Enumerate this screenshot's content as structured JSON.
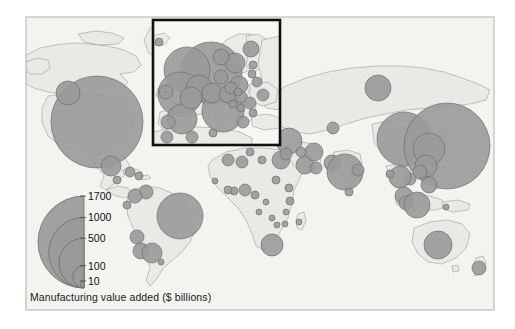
{
  "figure": {
    "type": "proportional-symbol-map",
    "caption": "Manufacturing value added ($ billions)",
    "frame": {
      "x": 26,
      "y": 17,
      "width": 468,
      "height": 293
    },
    "colors": {
      "background": "#f2f2ef",
      "land": "#e8e8e4",
      "ocean": "#f6f6f4",
      "border": "#8b8b86",
      "circle_fill": "#9a9a9a",
      "circle_stroke": "#6f6f6f",
      "frame_stroke": "#b4b4b0",
      "inset_stroke": "#111111",
      "text": "#111111"
    }
  },
  "inset": {
    "name": "europe-inset",
    "label": "",
    "x": 153,
    "y": 20,
    "width": 127,
    "height": 125
  },
  "legend": {
    "title": "Manufacturing value added ($ billions)",
    "unit": "$ billions",
    "anchor_x": 84,
    "baseline_y": 288,
    "max_value": 1700,
    "max_radius": 46,
    "breaks": [
      {
        "label": "1700",
        "value": 1700
      },
      {
        "label": "1000",
        "value": 1000
      },
      {
        "label": "500",
        "value": 500
      },
      {
        "label": "100",
        "value": 100
      },
      {
        "label": "10",
        "value": 10
      }
    ]
  },
  "chart_data": {
    "type": "scatter",
    "title": "Manufacturing value added ($ billions)",
    "xlabel": "",
    "ylabel": "",
    "encoding": "circle area proportional to value",
    "legend_values": [
      1700,
      1000,
      500,
      100,
      10
    ],
    "points": [
      {
        "name": "United States",
        "value": 1700,
        "cx": 97,
        "cy": 122,
        "r": 46
      },
      {
        "name": "Canada",
        "value": 100,
        "cx": 68,
        "cy": 93,
        "r": 12
      },
      {
        "name": "Mexico",
        "value": 90,
        "cx": 111,
        "cy": 166,
        "r": 10
      },
      {
        "name": "Guatemala",
        "value": 10,
        "cx": 117,
        "cy": 180,
        "r": 4
      },
      {
        "name": "Cuba",
        "value": 12,
        "cx": 130,
        "cy": 172,
        "r": 5
      },
      {
        "name": "Dominican Republic",
        "value": 8,
        "cx": 139,
        "cy": 176,
        "r": 4
      },
      {
        "name": "Venezuela",
        "value": 30,
        "cx": 146,
        "cy": 192,
        "r": 7
      },
      {
        "name": "Colombia",
        "value": 28,
        "cx": 135,
        "cy": 196,
        "r": 7
      },
      {
        "name": "Ecuador",
        "value": 9,
        "cx": 127,
        "cy": 205,
        "r": 4
      },
      {
        "name": "Brazil",
        "value": 400,
        "cx": 180,
        "cy": 216,
        "r": 23
      },
      {
        "name": "Peru",
        "value": 22,
        "cx": 137,
        "cy": 237,
        "r": 7
      },
      {
        "name": "Chile",
        "value": 25,
        "cx": 141,
        "cy": 251,
        "r": 8
      },
      {
        "name": "Argentina",
        "value": 60,
        "cx": 152,
        "cy": 253,
        "r": 10
      },
      {
        "name": "Uruguay",
        "value": 6,
        "cx": 161,
        "cy": 262,
        "r": 3
      },
      {
        "name": "Morocco",
        "value": 14,
        "cx": 228,
        "cy": 160,
        "r": 6
      },
      {
        "name": "Algeria",
        "value": 16,
        "cx": 242,
        "cy": 162,
        "r": 6
      },
      {
        "name": "Tunisia",
        "value": 9,
        "cx": 250,
        "cy": 152,
        "r": 4
      },
      {
        "name": "Libya",
        "value": 8,
        "cx": 262,
        "cy": 160,
        "r": 4
      },
      {
        "name": "Egypt",
        "value": 40,
        "cx": 281,
        "cy": 160,
        "r": 9
      },
      {
        "name": "Nigeria",
        "value": 20,
        "cx": 245,
        "cy": 190,
        "r": 6
      },
      {
        "name": "Ghana",
        "value": 8,
        "cx": 234,
        "cy": 191,
        "r": 4
      },
      {
        "name": "Ivory Coast",
        "value": 7,
        "cx": 228,
        "cy": 190,
        "r": 4
      },
      {
        "name": "Senegal",
        "value": 5,
        "cx": 215,
        "cy": 181,
        "r": 3
      },
      {
        "name": "Cameroon",
        "value": 7,
        "cx": 255,
        "cy": 195,
        "r": 4
      },
      {
        "name": "Sudan",
        "value": 9,
        "cx": 276,
        "cy": 180,
        "r": 4
      },
      {
        "name": "Ethiopia",
        "value": 7,
        "cx": 289,
        "cy": 188,
        "r": 4
      },
      {
        "name": "Kenya",
        "value": 8,
        "cx": 290,
        "cy": 201,
        "r": 4
      },
      {
        "name": "Tanzania",
        "value": 6,
        "cx": 286,
        "cy": 212,
        "r": 3
      },
      {
        "name": "Angola",
        "value": 6,
        "cx": 259,
        "cy": 212,
        "r": 3
      },
      {
        "name": "DR Congo",
        "value": 5,
        "cx": 266,
        "cy": 202,
        "r": 3
      },
      {
        "name": "Zambia",
        "value": 5,
        "cx": 272,
        "cy": 218,
        "r": 3
      },
      {
        "name": "Zimbabwe",
        "value": 6,
        "cx": 277,
        "cy": 225,
        "r": 3
      },
      {
        "name": "Mozambique",
        "value": 5,
        "cx": 285,
        "cy": 224,
        "r": 3
      },
      {
        "name": "Madagascar",
        "value": 4,
        "cx": 299,
        "cy": 222,
        "r": 3
      },
      {
        "name": "South Africa",
        "value": 80,
        "cx": 272,
        "cy": 245,
        "r": 11
      },
      {
        "name": "Turkey",
        "value": 110,
        "cx": 289,
        "cy": 141,
        "r": 13
      },
      {
        "name": "Israel",
        "value": 30,
        "cx": 286,
        "cy": 154,
        "r": 6
      },
      {
        "name": "Saudi Arabia",
        "value": 45,
        "cx": 305,
        "cy": 165,
        "r": 9
      },
      {
        "name": "Iran",
        "value": 55,
        "cx": 314,
        "cy": 152,
        "r": 9
      },
      {
        "name": "Iraq",
        "value": 14,
        "cx": 301,
        "cy": 152,
        "r": 5
      },
      {
        "name": "UAE",
        "value": 20,
        "cx": 316,
        "cy": 168,
        "r": 6
      },
      {
        "name": "Kazakhstan",
        "value": 22,
        "cx": 333,
        "cy": 128,
        "r": 6
      },
      {
        "name": "Russia",
        "value": 200,
        "cx": 378,
        "cy": 88,
        "r": 13
      },
      {
        "name": "Pakistan",
        "value": 35,
        "cx": 332,
        "cy": 163,
        "r": 8
      },
      {
        "name": "India",
        "value": 260,
        "cx": 345,
        "cy": 172,
        "r": 18
      },
      {
        "name": "Bangladesh",
        "value": 30,
        "cx": 358,
        "cy": 170,
        "r": 6
      },
      {
        "name": "Sri Lanka",
        "value": 8,
        "cx": 349,
        "cy": 192,
        "r": 4
      },
      {
        "name": "China",
        "value": 1300,
        "cx": 404,
        "cy": 139,
        "r": 27
      },
      {
        "name": "Japan",
        "value": 1700,
        "cx": 447,
        "cy": 146,
        "r": 43
      },
      {
        "name": "South Korea",
        "value": 300,
        "cx": 429,
        "cy": 149,
        "r": 16
      },
      {
        "name": "Taiwan",
        "value": 120,
        "cx": 426,
        "cy": 166,
        "r": 11
      },
      {
        "name": "Hong Kong",
        "value": 40,
        "cx": 420,
        "cy": 172,
        "r": 7
      },
      {
        "name": "Vietnam",
        "value": 25,
        "cx": 410,
        "cy": 179,
        "r": 6
      },
      {
        "name": "Thailand",
        "value": 90,
        "cx": 400,
        "cy": 177,
        "r": 11
      },
      {
        "name": "Myanmar",
        "value": 9,
        "cx": 390,
        "cy": 174,
        "r": 4
      },
      {
        "name": "Philippines",
        "value": 40,
        "cx": 429,
        "cy": 185,
        "r": 8
      },
      {
        "name": "Malaysia",
        "value": 55,
        "cx": 404,
        "cy": 196,
        "r": 9
      },
      {
        "name": "Singapore",
        "value": 40,
        "cx": 406,
        "cy": 203,
        "r": 7
      },
      {
        "name": "Indonesia",
        "value": 110,
        "cx": 417,
        "cy": 205,
        "r": 13
      },
      {
        "name": "Papua New Guinea",
        "value": 6,
        "cx": 446,
        "cy": 207,
        "r": 3
      },
      {
        "name": "Australia",
        "value": 130,
        "cx": 438,
        "cy": 245,
        "r": 14
      },
      {
        "name": "New Zealand",
        "value": 25,
        "cx": 479,
        "cy": 268,
        "r": 7
      }
    ],
    "inset_points": [
      {
        "name": "Germany",
        "value": 900,
        "cx": 211,
        "cy": 73,
        "r": 31
      },
      {
        "name": "France",
        "value": 450,
        "cx": 187,
        "cy": 70,
        "r": 23
      },
      {
        "name": "United Kingdom",
        "value": 420,
        "cx": 180,
        "cy": 94,
        "r": 22
      },
      {
        "name": "Italy",
        "value": 380,
        "cx": 223,
        "cy": 111,
        "r": 21
      },
      {
        "name": "Spain",
        "value": 220,
        "cx": 182,
        "cy": 119,
        "r": 15
      },
      {
        "name": "Netherlands",
        "value": 180,
        "cx": 199,
        "cy": 88,
        "r": 13
      },
      {
        "name": "Belgium",
        "value": 120,
        "cx": 191,
        "cy": 98,
        "r": 11
      },
      {
        "name": "Switzerland",
        "value": 110,
        "cx": 212,
        "cy": 93,
        "r": 10
      },
      {
        "name": "Austria",
        "value": 90,
        "cx": 228,
        "cy": 94,
        "r": 9
      },
      {
        "name": "Sweden",
        "value": 95,
        "cx": 235,
        "cy": 63,
        "r": 10
      },
      {
        "name": "Poland",
        "value": 85,
        "cx": 239,
        "cy": 85,
        "r": 9
      },
      {
        "name": "Norway",
        "value": 50,
        "cx": 221,
        "cy": 57,
        "r": 8
      },
      {
        "name": "Finland",
        "value": 45,
        "cx": 251,
        "cy": 49,
        "r": 8
      },
      {
        "name": "Denmark",
        "value": 50,
        "cx": 221,
        "cy": 77,
        "r": 7
      },
      {
        "name": "Ireland",
        "value": 45,
        "cx": 166,
        "cy": 92,
        "r": 7
      },
      {
        "name": "Portugal",
        "value": 40,
        "cx": 168,
        "cy": 122,
        "r": 7
      },
      {
        "name": "Czechia",
        "value": 40,
        "cx": 231,
        "cy": 88,
        "r": 6
      },
      {
        "name": "Hungary",
        "value": 35,
        "cx": 241,
        "cy": 97,
        "r": 6
      },
      {
        "name": "Greece",
        "value": 30,
        "cx": 243,
        "cy": 122,
        "r": 6
      },
      {
        "name": "Romania",
        "value": 28,
        "cx": 250,
        "cy": 103,
        "r": 6
      },
      {
        "name": "Belarus",
        "value": 22,
        "cx": 257,
        "cy": 82,
        "r": 5
      },
      {
        "name": "Ukraine",
        "value": 30,
        "cx": 263,
        "cy": 95,
        "r": 6
      },
      {
        "name": "Slovakia",
        "value": 18,
        "cx": 238,
        "cy": 92,
        "r": 4
      },
      {
        "name": "Bulgaria",
        "value": 15,
        "cx": 253,
        "cy": 113,
        "r": 4
      },
      {
        "name": "Serbia",
        "value": 12,
        "cx": 241,
        "cy": 108,
        "r": 4
      },
      {
        "name": "Croatia",
        "value": 12,
        "cx": 233,
        "cy": 104,
        "r": 4
      },
      {
        "name": "Iceland",
        "value": 8,
        "cx": 159,
        "cy": 42,
        "r": 4
      },
      {
        "name": "Estonia",
        "value": 8,
        "cx": 253,
        "cy": 65,
        "r": 4
      },
      {
        "name": "Lithuania",
        "value": 10,
        "cx": 252,
        "cy": 74,
        "r": 4
      },
      {
        "name": "Morocco-inset",
        "value": 14,
        "cx": 167,
        "cy": 137,
        "r": 6
      },
      {
        "name": "Algeria-inset",
        "value": 16,
        "cx": 192,
        "cy": 137,
        "r": 6
      },
      {
        "name": "Tunisia-inset",
        "value": 9,
        "cx": 213,
        "cy": 133,
        "r": 4
      }
    ]
  }
}
